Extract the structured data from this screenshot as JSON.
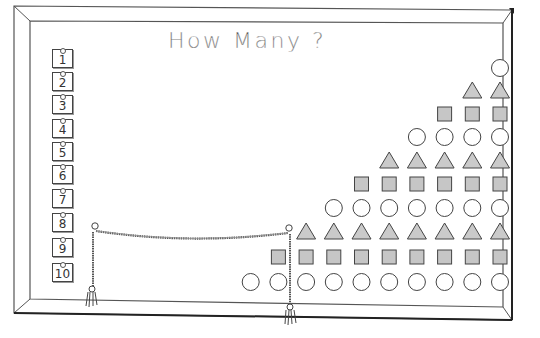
{
  "title": "How Many ?",
  "colors": {
    "ink": "#333333",
    "frame": "#444444",
    "fill": "#cfcfcf",
    "background": "#ffffff"
  },
  "number_cards": [
    {
      "label": "1",
      "y": 57
    },
    {
      "label": "2",
      "y": 80
    },
    {
      "label": "3",
      "y": 103
    },
    {
      "label": "4",
      "y": 127
    },
    {
      "label": "5",
      "y": 150
    },
    {
      "label": "6",
      "y": 173
    },
    {
      "label": "7",
      "y": 197
    },
    {
      "label": "8",
      "y": 221
    },
    {
      "label": "9",
      "y": 246
    },
    {
      "label": "10",
      "y": 271
    }
  ],
  "shape_rows": [
    {
      "count": 1,
      "shape": "circle",
      "y": 68
    },
    {
      "count": 2,
      "shape": "triangle",
      "y": 91
    },
    {
      "count": 3,
      "shape": "square",
      "y": 114
    },
    {
      "count": 4,
      "shape": "circle",
      "y": 137
    },
    {
      "count": 5,
      "shape": "triangle",
      "y": 161
    },
    {
      "count": 6,
      "shape": "square",
      "y": 184
    },
    {
      "count": 7,
      "shape": "circle",
      "y": 208
    },
    {
      "count": 8,
      "shape": "triangle",
      "y": 232
    },
    {
      "count": 9,
      "shape": "square",
      "y": 257
    },
    {
      "count": 10,
      "shape": "circle",
      "y": 282
    }
  ],
  "icons": {
    "circle": "circle-icon",
    "triangle": "triangle-icon",
    "square": "square-icon",
    "rope": "rope-pointer",
    "tassel": "tassel-icon"
  }
}
